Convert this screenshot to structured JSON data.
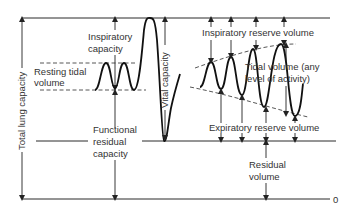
{
  "diagram": {
    "labels": {
      "total_lung_capacity": "Total lung capacity",
      "inspiratory_capacity_1": "Inspiratory",
      "inspiratory_capacity_2": "capacity",
      "resting_tidal_1": "Resting tidal",
      "resting_tidal_2": "volume",
      "vital_capacity": "Vital capacity",
      "frc_1": "Functional",
      "frc_2": "residual",
      "frc_3": "capacity",
      "irv": "Inspiratory reserve volume",
      "tidal_any_1": "Tidal volume (any",
      "tidal_any_2": "level of activity)",
      "erv": "Expiratory reserve volume",
      "rv_1": "Residual",
      "rv_2": "volume",
      "zero": "0"
    },
    "colors": {
      "line": "#2a2a2a",
      "text": "#333333",
      "background": "#ffffff"
    }
  }
}
